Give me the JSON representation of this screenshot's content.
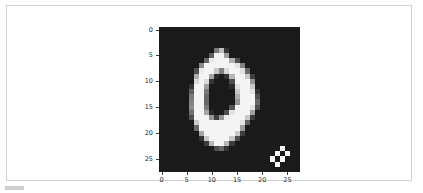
{
  "panel": {
    "type": "notebook-output-cell",
    "background": "#ffffff",
    "border_color": "#d2d2d2"
  },
  "chart_data": {
    "type": "heatmap",
    "title": "",
    "xlabel": "",
    "ylabel": "",
    "subtitle": "",
    "legend": [],
    "annotations": [],
    "grid": false,
    "colormap": "gray",
    "vmin": 0,
    "vmax": 255,
    "background": "#1a1a1a",
    "width_px": 28,
    "height_px": 28,
    "xlim": [
      -0.5,
      27.5
    ],
    "ylim": [
      27.5,
      -0.5
    ],
    "x_ticks": [
      0,
      5,
      10,
      15,
      20,
      25
    ],
    "y_ticks": [
      0,
      5,
      10,
      15,
      20,
      25
    ],
    "x_tick_labels": [
      "0",
      "5",
      "10",
      "15",
      "20",
      "25"
    ],
    "y_tick_labels": [
      "0",
      "5",
      "10",
      "15",
      "20",
      "25"
    ],
    "values": [
      [
        0,
        0,
        0,
        0,
        0,
        0,
        0,
        0,
        0,
        0,
        0,
        0,
        0,
        0,
        0,
        0,
        0,
        0,
        0,
        0,
        0,
        0,
        0,
        0,
        0,
        0,
        0,
        0
      ],
      [
        0,
        0,
        0,
        0,
        0,
        0,
        0,
        0,
        0,
        0,
        0,
        0,
        0,
        0,
        0,
        0,
        0,
        0,
        0,
        0,
        0,
        0,
        0,
        0,
        0,
        0,
        0,
        0
      ],
      [
        0,
        0,
        0,
        0,
        0,
        0,
        0,
        0,
        0,
        0,
        0,
        0,
        0,
        0,
        0,
        0,
        0,
        0,
        0,
        0,
        0,
        0,
        0,
        0,
        0,
        0,
        0,
        0
      ],
      [
        0,
        0,
        0,
        0,
        0,
        0,
        0,
        0,
        0,
        0,
        0,
        0,
        0,
        0,
        0,
        0,
        0,
        0,
        0,
        0,
        0,
        0,
        0,
        0,
        0,
        0,
        0,
        0
      ],
      [
        0,
        0,
        0,
        0,
        0,
        0,
        0,
        0,
        0,
        0,
        0,
        110,
        190,
        30,
        0,
        0,
        0,
        0,
        0,
        0,
        0,
        0,
        0,
        0,
        0,
        0,
        0,
        0
      ],
      [
        0,
        0,
        0,
        0,
        0,
        0,
        0,
        0,
        0,
        0,
        80,
        250,
        250,
        150,
        0,
        0,
        0,
        0,
        0,
        0,
        0,
        0,
        0,
        0,
        0,
        0,
        0,
        0
      ],
      [
        0,
        0,
        0,
        0,
        0,
        0,
        0,
        0,
        0,
        90,
        240,
        250,
        250,
        250,
        170,
        60,
        0,
        0,
        0,
        0,
        0,
        0,
        0,
        0,
        0,
        0,
        0,
        0
      ],
      [
        0,
        0,
        0,
        0,
        0,
        0,
        0,
        0,
        130,
        250,
        250,
        250,
        250,
        250,
        250,
        230,
        120,
        0,
        0,
        0,
        0,
        0,
        0,
        0,
        0,
        0,
        0,
        0
      ],
      [
        0,
        0,
        0,
        0,
        0,
        0,
        0,
        60,
        240,
        250,
        250,
        200,
        120,
        220,
        250,
        250,
        230,
        90,
        0,
        0,
        0,
        0,
        0,
        0,
        0,
        0,
        0,
        0
      ],
      [
        0,
        0,
        0,
        0,
        0,
        0,
        0,
        170,
        250,
        250,
        160,
        20,
        0,
        30,
        180,
        250,
        250,
        200,
        40,
        0,
        0,
        0,
        0,
        0,
        0,
        0,
        0,
        0
      ],
      [
        0,
        0,
        0,
        0,
        0,
        0,
        0,
        220,
        250,
        220,
        30,
        0,
        0,
        0,
        60,
        250,
        250,
        250,
        140,
        0,
        0,
        0,
        0,
        0,
        0,
        0,
        0,
        0
      ],
      [
        0,
        0,
        0,
        0,
        0,
        0,
        30,
        250,
        250,
        150,
        0,
        0,
        0,
        0,
        20,
        230,
        250,
        250,
        200,
        0,
        0,
        0,
        0,
        0,
        0,
        0,
        0,
        0
      ],
      [
        0,
        0,
        0,
        0,
        0,
        0,
        80,
        250,
        250,
        110,
        0,
        0,
        0,
        0,
        0,
        200,
        250,
        250,
        230,
        30,
        0,
        0,
        0,
        0,
        0,
        0,
        0,
        0
      ],
      [
        0,
        0,
        0,
        0,
        0,
        0,
        110,
        250,
        250,
        90,
        0,
        0,
        0,
        0,
        0,
        170,
        250,
        250,
        250,
        60,
        0,
        0,
        0,
        0,
        0,
        0,
        0,
        0
      ],
      [
        0,
        0,
        0,
        0,
        0,
        0,
        120,
        250,
        250,
        90,
        0,
        0,
        0,
        0,
        0,
        140,
        250,
        250,
        250,
        90,
        0,
        0,
        0,
        0,
        0,
        0,
        0,
        0
      ],
      [
        0,
        0,
        0,
        0,
        0,
        0,
        130,
        250,
        250,
        110,
        0,
        0,
        0,
        0,
        70,
        250,
        250,
        250,
        230,
        60,
        0,
        0,
        0,
        0,
        0,
        0,
        0,
        0
      ],
      [
        0,
        0,
        0,
        0,
        0,
        0,
        100,
        250,
        250,
        160,
        20,
        0,
        0,
        60,
        230,
        250,
        250,
        250,
        150,
        0,
        0,
        0,
        0,
        0,
        0,
        0,
        0,
        0
      ],
      [
        0,
        0,
        0,
        0,
        0,
        0,
        60,
        250,
        250,
        250,
        140,
        40,
        140,
        240,
        250,
        250,
        250,
        200,
        40,
        0,
        0,
        0,
        0,
        0,
        0,
        0,
        0,
        0
      ],
      [
        0,
        0,
        0,
        0,
        0,
        0,
        0,
        200,
        250,
        250,
        250,
        250,
        250,
        250,
        250,
        250,
        230,
        80,
        0,
        0,
        0,
        0,
        0,
        0,
        0,
        0,
        0,
        0
      ],
      [
        0,
        0,
        0,
        0,
        0,
        0,
        0,
        90,
        250,
        250,
        250,
        250,
        250,
        250,
        250,
        250,
        150,
        0,
        0,
        0,
        0,
        0,
        0,
        0,
        0,
        0,
        0,
        0
      ],
      [
        0,
        0,
        0,
        0,
        0,
        0,
        0,
        0,
        160,
        250,
        250,
        250,
        250,
        250,
        250,
        200,
        40,
        0,
        0,
        0,
        0,
        0,
        0,
        0,
        0,
        0,
        0,
        0
      ],
      [
        0,
        0,
        0,
        0,
        0,
        0,
        0,
        0,
        30,
        200,
        250,
        250,
        250,
        250,
        200,
        60,
        0,
        0,
        0,
        0,
        0,
        0,
        0,
        0,
        0,
        0,
        0,
        0
      ],
      [
        0,
        0,
        0,
        0,
        0,
        0,
        0,
        0,
        0,
        40,
        180,
        250,
        250,
        180,
        40,
        0,
        0,
        0,
        0,
        0,
        0,
        0,
        0,
        0,
        0,
        0,
        0,
        0
      ],
      [
        0,
        0,
        0,
        0,
        0,
        0,
        0,
        0,
        0,
        0,
        0,
        60,
        90,
        30,
        0,
        0,
        0,
        0,
        0,
        0,
        0,
        0,
        0,
        0,
        255,
        0,
        0,
        0
      ],
      [
        0,
        0,
        0,
        0,
        0,
        0,
        0,
        0,
        0,
        0,
        0,
        0,
        0,
        0,
        0,
        0,
        0,
        0,
        0,
        0,
        0,
        0,
        0,
        255,
        0,
        255,
        0,
        0
      ],
      [
        0,
        0,
        0,
        0,
        0,
        0,
        0,
        0,
        0,
        0,
        0,
        0,
        0,
        0,
        0,
        0,
        0,
        0,
        0,
        0,
        0,
        0,
        255,
        0,
        255,
        0,
        0,
        0
      ],
      [
        0,
        0,
        0,
        0,
        0,
        0,
        0,
        0,
        0,
        0,
        0,
        0,
        0,
        0,
        0,
        0,
        0,
        0,
        0,
        0,
        0,
        0,
        0,
        255,
        0,
        0,
        0,
        0
      ],
      [
        0,
        0,
        0,
        0,
        0,
        0,
        0,
        0,
        0,
        0,
        0,
        0,
        0,
        0,
        0,
        0,
        0,
        0,
        0,
        0,
        0,
        0,
        0,
        0,
        0,
        0,
        0,
        0
      ]
    ]
  }
}
